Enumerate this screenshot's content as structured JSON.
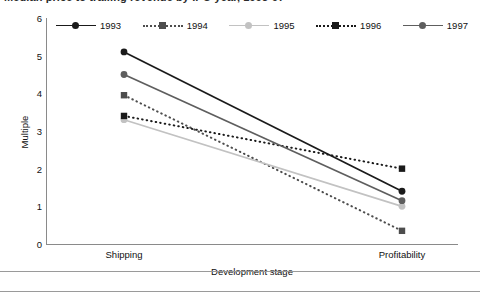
{
  "title": {
    "text": "Median price to trailing revenue by IPO year, 1993-97",
    "note": "clipped at top edge of screenshot"
  },
  "axes": {
    "ylabel": "Multiple",
    "xlabel": "Development stage",
    "yticks": [
      "6",
      "5",
      "4",
      "3",
      "2",
      "1",
      "0"
    ],
    "ylim": [
      0,
      6
    ],
    "categories": [
      "Shipping",
      "Profitability"
    ]
  },
  "legend": {
    "position": "top",
    "items": [
      {
        "label": "1993",
        "color": "#1a1a1a",
        "dash": "solid",
        "marker": "circle"
      },
      {
        "label": "1994",
        "color": "#4d4d4d",
        "dash": "dotted",
        "marker": "square"
      },
      {
        "label": "1995",
        "color": "#c2c2c2",
        "dash": "solid",
        "marker": "circle"
      },
      {
        "label": "1996",
        "color": "#1a1a1a",
        "dash": "dotted",
        "marker": "square"
      },
      {
        "label": "1997",
        "color": "#5e5e5e",
        "dash": "solid",
        "marker": "circle"
      }
    ]
  },
  "chart_data": {
    "type": "line",
    "title": "Median price to trailing revenue by IPO year, 1993-97",
    "xlabel": "Development stage",
    "ylabel": "Multiple",
    "categories": [
      "Shipping",
      "Profitability"
    ],
    "ylim": [
      0,
      6
    ],
    "yticks": [
      0,
      1,
      2,
      3,
      4,
      5,
      6
    ],
    "grid": false,
    "legend_position": "top",
    "series": [
      {
        "name": "1993",
        "values": [
          5.1,
          1.4
        ],
        "color": "#1a1a1a",
        "dash": "solid",
        "marker": "circle"
      },
      {
        "name": "1994",
        "values": [
          3.95,
          0.35
        ],
        "color": "#4d4d4d",
        "dash": "dotted",
        "marker": "square"
      },
      {
        "name": "1995",
        "values": [
          3.3,
          1.0
        ],
        "color": "#c2c2c2",
        "dash": "solid",
        "marker": "circle"
      },
      {
        "name": "1996",
        "values": [
          3.4,
          2.0
        ],
        "color": "#1a1a1a",
        "dash": "dotted",
        "marker": "square"
      },
      {
        "name": "1997",
        "values": [
          4.5,
          1.15
        ],
        "color": "#5e5e5e",
        "dash": "solid",
        "marker": "circle"
      }
    ]
  }
}
